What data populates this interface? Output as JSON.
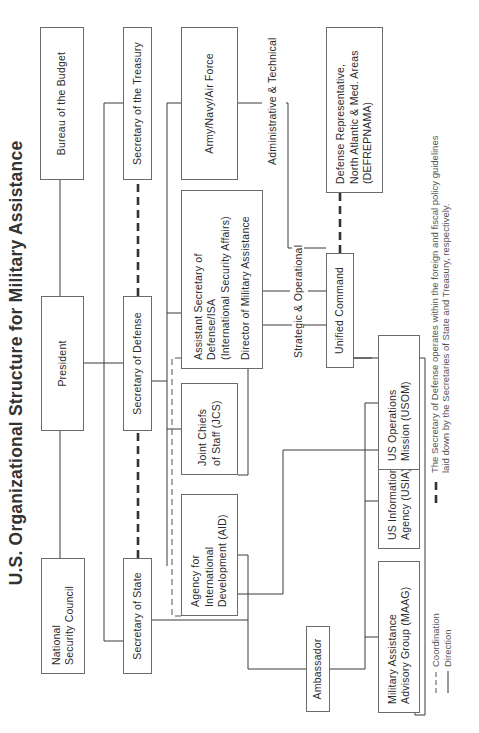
{
  "title": "U.S. Organizational Structure for Military Assistance",
  "boxes": {
    "bureau_budget": "Bureau of the Budget",
    "president": "President",
    "nsc": "National\nSecurity Council",
    "sec_treasury": "Secretary of the Treasury",
    "sec_defense": "Secretary of Defense",
    "sec_state": "Secretary of State",
    "army_navy_af": "Army/Navy/Air Force",
    "asst_sec_defense": "Assistant Secretary of\nDefense/ISA\n(International Security Affairs)",
    "director_mil_assist": "Director of Military Assistance",
    "jcs": "Joint Chiefs\nof Staff (JCS)",
    "aid": "Agency for\nInternational\nDevelopment (AID)",
    "ambassador": "Ambassador",
    "unified_command": "Unified Command",
    "defrepnama": "Defense Representative,\nNorth Atlantic & Med. Areas\n(DEFREPNAMA)",
    "usom": "US Operations\nMission (USOM)",
    "usia": "US Information\nAgency (USIA)",
    "maag": "Military Assistance\nAdvisory Group (MAAG)"
  },
  "connector_labels": {
    "strategic": "Strategic & Operational",
    "admin": "Administrative & Technical"
  },
  "legend": {
    "coordination": "Coordination",
    "direction": "Direction",
    "note": "The Secretary of Defense operates within the foreign and fiscal policy guidelines\nlaid down by the Secretaries of State and Treasury, respectively."
  },
  "colors": {
    "line": "#3a3a3a",
    "box_border": "#6b6b6b",
    "text": "#2c2c2c",
    "background": "#ffffff"
  }
}
